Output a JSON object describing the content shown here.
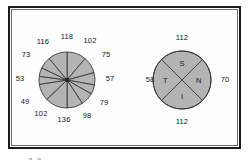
{
  "figure": {
    "background_color": "#ffffff",
    "frame_color": "#1b1b1b",
    "sector_fill": "#b4b4b4",
    "sector_stroke": "#3a3a3a",
    "caption_fragment": "a a"
  },
  "rose_diagram": {
    "name": "12-sector rose diagram",
    "center": {
      "x": 67,
      "y": 80
    },
    "radius": 28,
    "hub": {
      "size": 4,
      "color": "#262626"
    },
    "sector_count": 12,
    "labels": [
      {
        "text": "118",
        "x": 67,
        "y": 37
      },
      {
        "text": "102",
        "x": 90,
        "y": 41
      },
      {
        "text": "75",
        "x": 106,
        "y": 55
      },
      {
        "text": "57",
        "x": 110,
        "y": 79
      },
      {
        "text": "79",
        "x": 104,
        "y": 103
      },
      {
        "text": "98",
        "x": 87,
        "y": 116
      },
      {
        "text": "136",
        "x": 64,
        "y": 120
      },
      {
        "text": "102",
        "x": 41,
        "y": 114
      },
      {
        "text": "49",
        "x": 25,
        "y": 102
      },
      {
        "text": "53",
        "x": 20,
        "y": 79
      },
      {
        "text": "73",
        "x": 26,
        "y": 55
      },
      {
        "text": "116",
        "x": 43,
        "y": 42
      }
    ],
    "chart_data": {
      "type": "pie",
      "title": "",
      "categories": [
        "118",
        "102",
        "75",
        "57",
        "79",
        "98",
        "136",
        "102",
        "49",
        "53",
        "73",
        "116"
      ],
      "values": [
        118,
        102,
        75,
        57,
        79,
        98,
        136,
        102,
        49,
        53,
        73,
        116
      ],
      "legend": "none",
      "grid": false
    }
  },
  "quadrant_diagram": {
    "name": "4-quadrant circle",
    "center": {
      "x": 182,
      "y": 80
    },
    "radius": 29,
    "sectors": [
      {
        "letter": "S",
        "position": "top"
      },
      {
        "letter": "N",
        "position": "right"
      },
      {
        "letter": "I",
        "position": "bottom"
      },
      {
        "letter": "T",
        "position": "left"
      }
    ],
    "labels": [
      {
        "text": "112",
        "x": 182,
        "y": 38
      },
      {
        "text": "70",
        "x": 225,
        "y": 80
      },
      {
        "text": "112",
        "x": 182,
        "y": 122
      },
      {
        "text": "58",
        "x": 150,
        "y": 80
      }
    ],
    "chart_data": {
      "type": "pie",
      "title": "",
      "categories": [
        "S",
        "N",
        "I",
        "T"
      ],
      "values": [
        112,
        70,
        112,
        58
      ],
      "legend": "none",
      "grid": false
    }
  }
}
